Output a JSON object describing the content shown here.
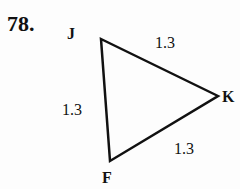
{
  "problem": {
    "number": "78.",
    "vertices": [
      {
        "name": "J",
        "x": 101,
        "y": 39
      },
      {
        "name": "K",
        "x": 218,
        "y": 96
      },
      {
        "name": "F",
        "x": 110,
        "y": 161
      }
    ],
    "sides": [
      {
        "from": "J",
        "to": "K",
        "length": "1.3"
      },
      {
        "from": "J",
        "to": "F",
        "length": "1.3"
      },
      {
        "from": "F",
        "to": "K",
        "length": "1.3"
      }
    ],
    "stroke_color": "#111111"
  }
}
